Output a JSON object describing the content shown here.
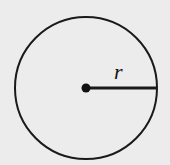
{
  "diagram": {
    "type": "circle-with-radius",
    "radius_label": "r",
    "colors": {
      "background": "#ececec",
      "stroke": "#1a1a1a"
    }
  }
}
